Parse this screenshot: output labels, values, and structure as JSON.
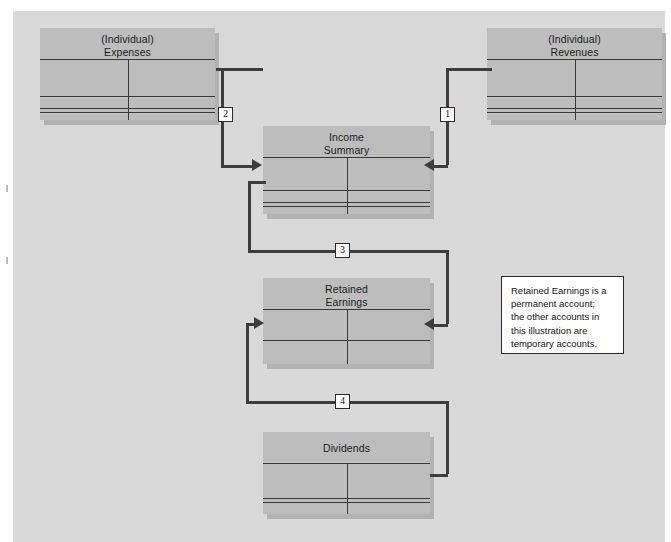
{
  "diagram": {
    "panel_color": "#d9d9d9",
    "account_color": "#bdbdbd",
    "line_color": "#3d3d3d",
    "accounts": [
      {
        "id": "expenses",
        "title_line1": "(Individual)",
        "title_line2": "Expenses",
        "kind": "temporary"
      },
      {
        "id": "revenues",
        "title_line1": "(Individual)",
        "title_line2": "Revenues",
        "kind": "temporary"
      },
      {
        "id": "income-summary",
        "title_line1": "Income",
        "title_line2": "Summary",
        "kind": "temporary"
      },
      {
        "id": "retained-earnings",
        "title_line1": "Retained",
        "title_line2": "Earnings",
        "kind": "permanent"
      },
      {
        "id": "dividends",
        "title_line1": "Dividends",
        "title_line2": "",
        "kind": "temporary"
      }
    ],
    "steps": [
      {
        "number": "1",
        "from": "revenues",
        "to": "income-summary"
      },
      {
        "number": "2",
        "from": "expenses",
        "to": "income-summary"
      },
      {
        "number": "3",
        "from": "income-summary",
        "to": "retained-earnings"
      },
      {
        "number": "4",
        "from": "dividends",
        "to": "retained-earnings"
      }
    ],
    "note": {
      "line1": "Retained Earnings is a",
      "line2": "permanent account;",
      "line3": "the other accounts in",
      "line4": "this illustration are",
      "line5": "temporary accounts."
    }
  }
}
